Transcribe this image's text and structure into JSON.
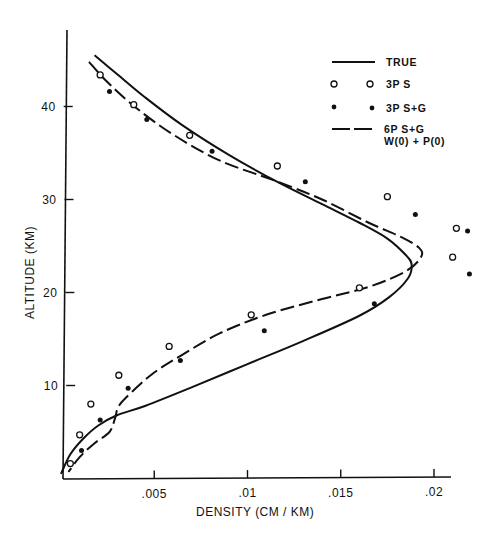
{
  "chart_data": {
    "type": "line",
    "title": "",
    "xlabel": "DENSITY  (CM / KM)",
    "ylabel": "ALTITUDE  (KM)",
    "xlim": [
      0,
      0.0208
    ],
    "ylim": [
      0,
      48
    ],
    "x_ticks": [
      ".005",
      ".01",
      ".015",
      ".02"
    ],
    "x_tick_values": [
      0.005,
      0.01,
      0.015,
      0.02
    ],
    "y_ticks": [
      "10",
      "20",
      "30",
      "40"
    ],
    "y_tick_values": [
      10,
      20,
      30,
      40
    ],
    "grid": false,
    "legend_position": "upper right",
    "legend": [
      {
        "label": "TRUE",
        "style": "solid-line"
      },
      {
        "label": "3P  S",
        "style": "open-circle"
      },
      {
        "label": "3P  S+G",
        "style": "filled-circle"
      },
      {
        "label": "6P  S+G",
        "label2": "W(0) + P(0)",
        "style": "dashed-line"
      }
    ],
    "series": [
      {
        "name": "TRUE",
        "kind": "line",
        "points": [
          [
            0.0018,
            45.5
          ],
          [
            0.003,
            43.5
          ],
          [
            0.0045,
            41.0
          ],
          [
            0.0065,
            38.0
          ],
          [
            0.009,
            34.8
          ],
          [
            0.0115,
            32.0
          ],
          [
            0.014,
            29.5
          ],
          [
            0.016,
            27.5
          ],
          [
            0.0175,
            25.8
          ],
          [
            0.0185,
            24.0
          ],
          [
            0.0188,
            23.0
          ],
          [
            0.0186,
            21.5
          ],
          [
            0.0176,
            19.5
          ],
          [
            0.016,
            17.5
          ],
          [
            0.013,
            14.8
          ],
          [
            0.01,
            12.3
          ],
          [
            0.007,
            9.8
          ],
          [
            0.0045,
            7.8
          ],
          [
            0.003,
            6.8
          ],
          [
            0.002,
            5.7
          ],
          [
            0.0012,
            4.3
          ],
          [
            0.0005,
            2.6
          ],
          [
            0.0,
            0.5
          ]
        ]
      },
      {
        "name": "6P S+G W(0)+P(0)",
        "kind": "line",
        "points": [
          [
            0.0015,
            44.8
          ],
          [
            0.0025,
            42.6
          ],
          [
            0.004,
            39.9
          ],
          [
            0.006,
            37.0
          ],
          [
            0.0085,
            34.2
          ],
          [
            0.0115,
            32.0
          ],
          [
            0.014,
            30.0
          ],
          [
            0.0165,
            27.5
          ],
          [
            0.0182,
            26.0
          ],
          [
            0.0192,
            24.8
          ],
          [
            0.0193,
            23.8
          ],
          [
            0.0185,
            22.3
          ],
          [
            0.0165,
            20.6
          ],
          [
            0.014,
            19.3
          ],
          [
            0.011,
            17.6
          ],
          [
            0.0085,
            15.6
          ],
          [
            0.0065,
            13.3
          ],
          [
            0.005,
            11.4
          ],
          [
            0.0038,
            9.3
          ],
          [
            0.0031,
            7.8
          ],
          [
            0.0029,
            6.5
          ],
          [
            0.0026,
            5.0
          ],
          [
            0.0018,
            3.8
          ],
          [
            0.001,
            2.3
          ],
          [
            0.0004,
            0.7
          ]
        ]
      },
      {
        "name": "3P S",
        "kind": "scatter",
        "marker": "open-circle",
        "points": [
          [
            0.0021,
            43.4
          ],
          [
            0.0039,
            40.2
          ],
          [
            0.0069,
            36.9
          ],
          [
            0.0116,
            33.6
          ],
          [
            0.0175,
            30.3
          ],
          [
            0.0212,
            26.9
          ],
          [
            0.021,
            23.8
          ],
          [
            0.016,
            20.5
          ],
          [
            0.0102,
            17.6
          ],
          [
            0.0058,
            14.2
          ],
          [
            0.0031,
            11.1
          ],
          [
            0.0016,
            8.0
          ],
          [
            0.001,
            4.7
          ],
          [
            0.0005,
            1.6
          ]
        ]
      },
      {
        "name": "3P S+G",
        "kind": "scatter",
        "marker": "filled-circle",
        "points": [
          [
            0.0026,
            41.6
          ],
          [
            0.0046,
            38.6
          ],
          [
            0.0081,
            35.2
          ],
          [
            0.0131,
            31.9
          ],
          [
            0.019,
            28.4
          ],
          [
            0.0218,
            26.6
          ],
          [
            0.0219,
            22.0
          ],
          [
            0.0168,
            18.8
          ],
          [
            0.0109,
            15.9
          ],
          [
            0.0064,
            12.7
          ],
          [
            0.0036,
            9.7
          ],
          [
            0.0021,
            6.3
          ],
          [
            0.0011,
            3.0
          ]
        ]
      }
    ]
  }
}
